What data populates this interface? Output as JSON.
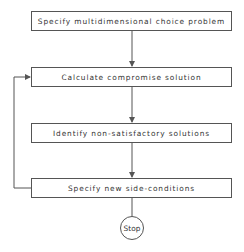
{
  "flowchart": {
    "steps": [
      {
        "label": "Specify multidimensional choice problem"
      },
      {
        "label": "Calculate compromise solution"
      },
      {
        "label": "Identify non-satisfactory solutions"
      },
      {
        "label": "Specify new side-conditions"
      }
    ],
    "terminal": {
      "label": "Stop"
    },
    "loop": {
      "from": "Specify new side-conditions",
      "to": "Calculate compromise solution"
    },
    "colors": {
      "line": "#555555",
      "text": "#333333",
      "background": "#ffffff"
    }
  }
}
